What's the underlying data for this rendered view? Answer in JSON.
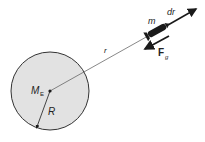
{
  "diagram": {
    "title": "",
    "labels": {
      "mass_small": "m",
      "displacement": "dr",
      "force": "F",
      "force_subscript": "g",
      "distance": "r",
      "earth_mass": "M",
      "earth_mass_subscript": "E",
      "radius": "R"
    },
    "colors": {
      "earth_fill": "#e2e2e2",
      "earth_stroke": "#333333",
      "line": "#444444",
      "rocket": "#1a1a1a"
    }
  }
}
